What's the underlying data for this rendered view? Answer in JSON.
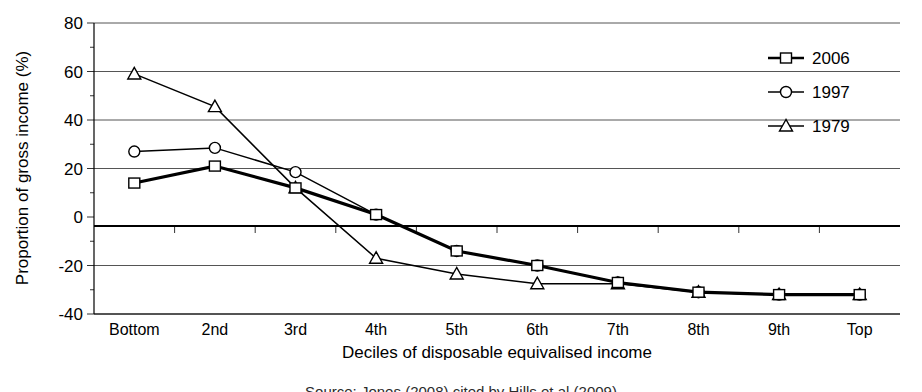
{
  "chart_data": {
    "type": "line",
    "title": "",
    "xlabel": "Deciles of disposable equivalised income",
    "ylabel": "Proportion of gross income (%)",
    "categories": [
      "Bottom",
      "2nd",
      "3rd",
      "4th",
      "5th",
      "6th",
      "7th",
      "8th",
      "9th",
      "Top"
    ],
    "ylim": [
      -40,
      80
    ],
    "yticks": [
      -40,
      -20,
      0,
      20,
      40,
      60,
      80
    ],
    "ytick_labels": [
      "-40",
      "-20",
      "0",
      "20",
      "40",
      "60",
      "80"
    ],
    "grid": true,
    "legend_position": "top-right",
    "series": [
      {
        "name": "2006",
        "marker": "square",
        "values": [
          14,
          21,
          12,
          1,
          -14,
          -20,
          -27,
          -31,
          -32,
          -32
        ]
      },
      {
        "name": "1997",
        "marker": "circle",
        "values": [
          27,
          28.5,
          18.5,
          1,
          -14,
          -20,
          -27,
          -31,
          -32,
          -32
        ]
      },
      {
        "name": "1979",
        "marker": "triangle",
        "values": [
          59,
          45.5,
          12,
          -17,
          -23.5,
          -27.5,
          -27.5,
          -31,
          -32,
          -32
        ]
      }
    ]
  },
  "caption": {
    "partial_text": "Source: Jones (2008) cited by Hills et al (2009)"
  }
}
